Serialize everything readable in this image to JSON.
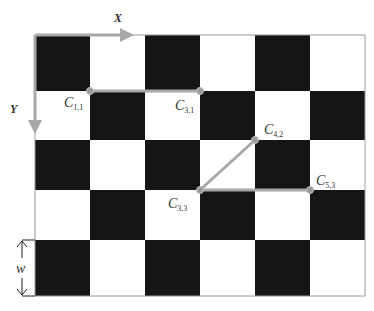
{
  "diagram": {
    "type": "checkerboard-corner-indexing",
    "grid": {
      "columns": 6,
      "rows": 5,
      "top_left_color": "black"
    },
    "colors": {
      "dark_square": "#151515",
      "light_square": "#ffffff",
      "connector": "#a8a8a8",
      "border": "#9a9a9a",
      "text": "#333333"
    },
    "axes": {
      "x_label": "X",
      "y_label": "Y"
    },
    "width_marker": {
      "label": "w"
    },
    "corners": [
      {
        "id": "c11",
        "label": "C",
        "sub": "1,1"
      },
      {
        "id": "c31",
        "label": "C",
        "sub": "3,1"
      },
      {
        "id": "c42",
        "label": "C",
        "sub": "4,2"
      },
      {
        "id": "c33",
        "label": "C",
        "sub": "3,3"
      },
      {
        "id": "c53",
        "label": "C",
        "sub": "5,3"
      }
    ],
    "connections": [
      [
        "C1,1",
        "C3,1"
      ],
      [
        "C3,3",
        "C4,2"
      ],
      [
        "C3,3",
        "C5,3"
      ]
    ]
  }
}
